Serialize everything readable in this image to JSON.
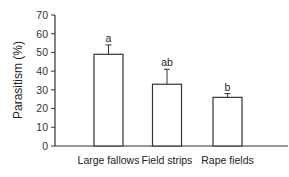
{
  "chart_data": {
    "type": "bar",
    "title": "",
    "xlabel": "",
    "ylabel": "Parasitism (%)",
    "ylim": [
      0,
      70
    ],
    "yticks": [
      0,
      10,
      20,
      30,
      40,
      50,
      60,
      70
    ],
    "grid": false,
    "legend": null,
    "categories": [
      "Large fallows",
      "Field strips",
      "Rape fields"
    ],
    "values": [
      49,
      33,
      26
    ],
    "error": [
      5,
      8,
      2
    ],
    "annotations": [
      "a",
      "ab",
      "b"
    ],
    "bar_fill": "#ffffff",
    "bar_stroke": "#333333"
  }
}
